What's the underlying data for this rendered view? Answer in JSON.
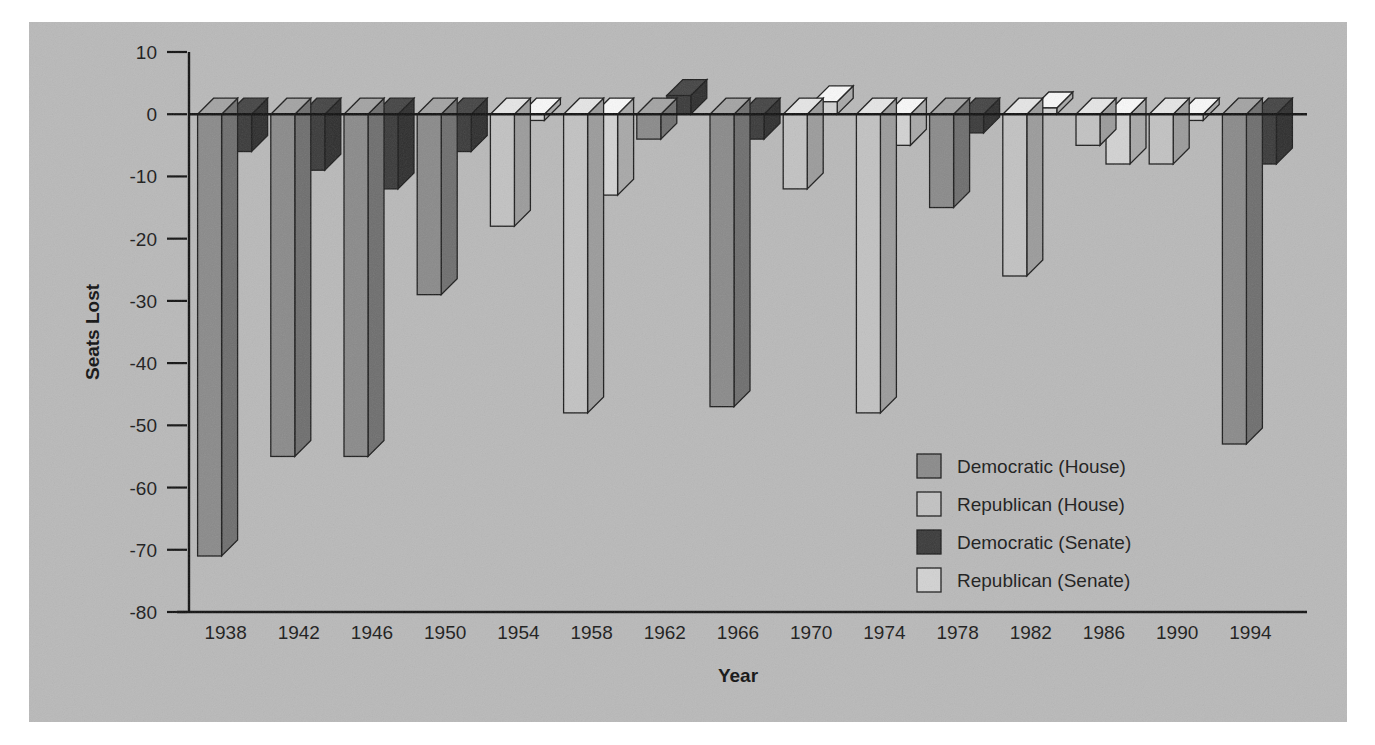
{
  "figure": {
    "background_color": "#b9b9b9",
    "page_color": "#ffffff"
  },
  "axes": {
    "ylabel": "Seats Lost",
    "xlabel": "Year",
    "y_ticks": [
      "10",
      "0",
      "-10",
      "-20",
      "-30",
      "-40",
      "-50",
      "-60",
      "-70",
      "-80"
    ],
    "x_ticks": [
      "1938",
      "1942",
      "1946",
      "1950",
      "1954",
      "1958",
      "1962",
      "1966",
      "1970",
      "1974",
      "1978",
      "1982",
      "1986",
      "1990",
      "1994"
    ]
  },
  "legend": {
    "items": [
      {
        "label": "Democratic (House)",
        "color": "#8a8a8a"
      },
      {
        "label": "Republican (House)",
        "color": "#c2c2c2"
      },
      {
        "label": "Democratic (Senate)",
        "color": "#3a3a3a"
      },
      {
        "label": "Republican (Senate)",
        "color": "#d2d2d2"
      }
    ]
  },
  "chart_data": {
    "type": "bar",
    "title": "",
    "xlabel": "Year",
    "ylabel": "Seats Lost",
    "ylim": [
      -80,
      10
    ],
    "ytick_step": 10,
    "grid": false,
    "legend_position": "inside-right",
    "categories": [
      "1938",
      "1942",
      "1946",
      "1950",
      "1954",
      "1958",
      "1962",
      "1966",
      "1970",
      "1974",
      "1978",
      "1982",
      "1986",
      "1990",
      "1994"
    ],
    "series": [
      {
        "name": "Democratic (House)",
        "color": "#8a8a8a",
        "values": [
          -71,
          -55,
          -55,
          -29,
          null,
          null,
          -4,
          -47,
          null,
          null,
          -15,
          null,
          null,
          null,
          -53
        ]
      },
      {
        "name": "Republican (House)",
        "color": "#c2c2c2",
        "values": [
          null,
          null,
          null,
          null,
          -18,
          -48,
          null,
          null,
          -12,
          -48,
          null,
          -26,
          -5,
          -8,
          null
        ]
      },
      {
        "name": "Democratic (Senate)",
        "color": "#3a3a3a",
        "values": [
          -6,
          -9,
          -12,
          -6,
          null,
          null,
          3,
          -4,
          null,
          null,
          -3,
          null,
          null,
          null,
          -8
        ]
      },
      {
        "name": "Republican (Senate)",
        "color": "#d2d2d2",
        "values": [
          null,
          null,
          null,
          null,
          -1,
          -13,
          null,
          null,
          2,
          -5,
          null,
          1,
          null,
          -1,
          null
        ]
      }
    ],
    "bars": [
      {
        "year": "1938",
        "house_party": "Democratic",
        "house_value": -71,
        "senate_party": "Democratic",
        "senate_value": -6
      },
      {
        "year": "1942",
        "house_party": "Democratic",
        "house_value": -55,
        "senate_party": "Democratic",
        "senate_value": -9
      },
      {
        "year": "1946",
        "house_party": "Democratic",
        "house_value": -55,
        "senate_party": "Democratic",
        "senate_value": -12
      },
      {
        "year": "1950",
        "house_party": "Democratic",
        "house_value": -29,
        "senate_party": "Democratic",
        "senate_value": -6
      },
      {
        "year": "1954",
        "house_party": "Republican",
        "house_value": -18,
        "senate_party": "Republican",
        "senate_value": -1
      },
      {
        "year": "1958",
        "house_party": "Republican",
        "house_value": -48,
        "senate_party": "Republican",
        "senate_value": -13
      },
      {
        "year": "1962",
        "house_party": "Democratic",
        "house_value": -4,
        "senate_party": "Democratic",
        "senate_value": 3
      },
      {
        "year": "1966",
        "house_party": "Democratic",
        "house_value": -47,
        "senate_party": "Democratic",
        "senate_value": -4
      },
      {
        "year": "1970",
        "house_party": "Republican",
        "house_value": -12,
        "senate_party": "Republican",
        "senate_value": 2
      },
      {
        "year": "1974",
        "house_party": "Republican",
        "house_value": -48,
        "senate_party": "Republican",
        "senate_value": -5
      },
      {
        "year": "1978",
        "house_party": "Democratic",
        "house_value": -15,
        "senate_party": "Democratic",
        "senate_value": -3
      },
      {
        "year": "1982",
        "house_party": "Republican",
        "house_value": -26,
        "senate_party": "Republican",
        "senate_value": 1
      },
      {
        "year": "1986",
        "house_party": "Republican",
        "house_value": -5,
        "senate_party": "Republican",
        "senate_value": -8
      },
      {
        "year": "1990",
        "house_party": "Republican",
        "house_value": -8,
        "senate_party": "Republican",
        "senate_value": -1
      },
      {
        "year": "1994",
        "house_party": "Democratic",
        "house_value": -53,
        "senate_party": "Democratic",
        "senate_value": -8
      }
    ]
  }
}
